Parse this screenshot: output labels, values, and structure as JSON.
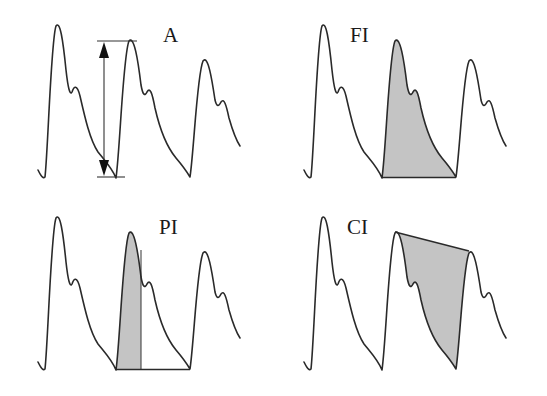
{
  "figure": {
    "panels": [
      {
        "id": "A",
        "label": "A",
        "meaning": "amplitude",
        "annotation": "double-headed vertical arrow from trough to second-beat peak"
      },
      {
        "id": "FI",
        "label": "FI",
        "meaning": "full-beat area index",
        "annotation": "shaded area under entire second beat"
      },
      {
        "id": "PI",
        "label": "PI",
        "meaning": "peak/systolic area index",
        "annotation": "shaded area under upstroke of second beat up to vertical line"
      },
      {
        "id": "CI",
        "label": "CI",
        "meaning": "area between peak chord and descending limb",
        "annotation": "shaded region between line connecting second and third peaks and the descending curve"
      }
    ]
  },
  "colors": {
    "background": "#ffffff",
    "waveform": "#2a2a2a",
    "shading": "#c4c4c4",
    "annotation": "#333333"
  }
}
